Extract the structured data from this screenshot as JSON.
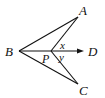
{
  "diagram": {
    "points": {
      "A": {
        "label": "A",
        "x": 78,
        "y": 17
      },
      "B": {
        "label": "B",
        "x": 19,
        "y": 51
      },
      "C": {
        "label": "C",
        "x": 78,
        "y": 84
      },
      "P": {
        "label": "P",
        "x": 51,
        "y": 51
      },
      "D": {
        "label": "D",
        "x": 82,
        "y": 51
      }
    },
    "angles": {
      "x": "x",
      "y": "y"
    },
    "segments": [
      "BA",
      "BC",
      "PA",
      "PC",
      "BD"
    ],
    "stroke_color": "#111111"
  }
}
